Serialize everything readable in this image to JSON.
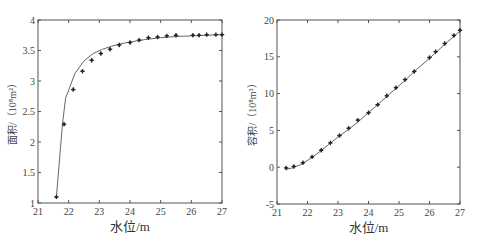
{
  "chart_data": [
    {
      "type": "line",
      "title": "",
      "xlabel": "水位/m",
      "ylabel": "面积/（10⁸m²）",
      "xlim": [
        21,
        27
      ],
      "ylim": [
        1,
        4
      ],
      "xticks": [
        "21",
        "22",
        "23",
        "24",
        "25",
        "26",
        "27"
      ],
      "yticks": [
        "1",
        "1.5",
        "2",
        "2.5",
        "3",
        "3.5",
        "4"
      ],
      "grid": false,
      "series": [
        {
          "name": "fitted curve",
          "style": "line",
          "x": [
            21.6,
            21.8,
            21.9,
            22.0,
            22.2,
            22.5,
            22.8,
            23.1,
            23.4,
            23.7,
            24.0,
            24.5,
            25.0,
            25.5,
            26.0,
            26.5,
            27.0
          ],
          "y": [
            1.1,
            2.3,
            2.72,
            2.85,
            3.12,
            3.33,
            3.45,
            3.52,
            3.57,
            3.61,
            3.64,
            3.68,
            3.71,
            3.73,
            3.74,
            3.75,
            3.76
          ]
        },
        {
          "name": "measured",
          "style": "markers",
          "x": [
            21.6,
            21.85,
            22.15,
            22.45,
            22.75,
            23.05,
            23.35,
            23.65,
            24.0,
            24.3,
            24.6,
            24.9,
            25.2,
            25.5,
            26.05,
            26.25,
            26.5,
            26.8,
            27.0
          ],
          "y": [
            1.1,
            2.29,
            2.86,
            3.16,
            3.34,
            3.45,
            3.52,
            3.59,
            3.63,
            3.67,
            3.71,
            3.72,
            3.74,
            3.75,
            3.75,
            3.75,
            3.76,
            3.76,
            3.76
          ]
        }
      ]
    },
    {
      "type": "line",
      "title": "",
      "xlabel": "水位/m",
      "ylabel": "容积/（10⁸m³）",
      "xlim": [
        21,
        27
      ],
      "ylim": [
        -5,
        20
      ],
      "xticks": [
        "21",
        "22",
        "23",
        "24",
        "25",
        "26",
        "27"
      ],
      "yticks": [
        "-5",
        "0",
        "5",
        "10",
        "15",
        "20"
      ],
      "grid": false,
      "series": [
        {
          "name": "fitted curve",
          "style": "line",
          "x": [
            21.3,
            21.5,
            21.8,
            22.1,
            22.4,
            22.7,
            23.0,
            23.4,
            23.7,
            24.0,
            24.3,
            24.6,
            24.9,
            25.2,
            25.5,
            26.0,
            26.5,
            27.0
          ],
          "y": [
            -0.3,
            -0.1,
            0.4,
            1.2,
            2.1,
            3.1,
            4.1,
            5.3,
            6.3,
            7.4,
            8.5,
            9.6,
            10.7,
            11.8,
            13.0,
            14.8,
            16.7,
            18.5
          ]
        },
        {
          "name": "measured",
          "style": "markers",
          "x": [
            21.3,
            21.55,
            21.85,
            22.15,
            22.45,
            22.75,
            23.05,
            23.35,
            23.65,
            24.0,
            24.3,
            24.6,
            24.9,
            25.2,
            25.5,
            26.0,
            26.2,
            26.5,
            26.8,
            27.0
          ],
          "y": [
            -0.1,
            0.1,
            0.6,
            1.4,
            2.3,
            3.3,
            4.3,
            5.3,
            6.4,
            7.4,
            8.5,
            9.7,
            10.8,
            11.9,
            13.0,
            14.9,
            15.7,
            16.8,
            17.9,
            18.6
          ]
        }
      ]
    }
  ]
}
